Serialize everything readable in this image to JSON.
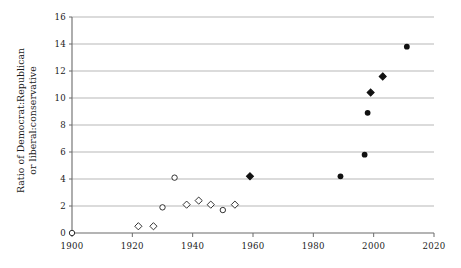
{
  "chart_data": {
    "type": "scatter",
    "title": "",
    "xlabel": "",
    "ylabel": "Ratio of Democrat:Republican or liberal:conservative",
    "ylabel_line1": "Ratio of Democrat:Republican",
    "ylabel_line2": "or liberal:conservative",
    "xlim": [
      1900,
      2020
    ],
    "ylim": [
      0,
      16
    ],
    "xticks": [
      1900,
      1920,
      1940,
      1960,
      1980,
      2000,
      2020
    ],
    "xtick_labels": [
      "1900",
      "1920",
      "1940",
      "1960",
      "1980",
      "2000",
      "2020"
    ],
    "yticks": [
      0,
      2,
      4,
      6,
      8,
      10,
      12,
      14,
      16
    ],
    "ytick_labels": [
      "0",
      "2",
      "4",
      "6",
      "8",
      "10",
      "12",
      "14",
      "16"
    ],
    "grid": "horizontal",
    "grid_color": "#9a9a9a",
    "axis_color": "#6b6b6b",
    "marker_color": "#111111",
    "series": [
      {
        "name": "open-circle",
        "marker": "open-circle",
        "points": [
          {
            "x": 1900,
            "y": 0.0
          },
          {
            "x": 1934,
            "y": 4.1
          },
          {
            "x": 1930,
            "y": 1.9
          },
          {
            "x": 1950,
            "y": 1.7
          }
        ]
      },
      {
        "name": "open-diamond",
        "marker": "open-diamond",
        "points": [
          {
            "x": 1922,
            "y": 0.5
          },
          {
            "x": 1927,
            "y": 0.5
          },
          {
            "x": 1938,
            "y": 2.1
          },
          {
            "x": 1942,
            "y": 2.4
          },
          {
            "x": 1946,
            "y": 2.1
          },
          {
            "x": 1954,
            "y": 2.1
          }
        ]
      },
      {
        "name": "filled-diamond",
        "marker": "filled-diamond",
        "points": [
          {
            "x": 1959,
            "y": 4.2
          },
          {
            "x": 1999,
            "y": 10.4
          },
          {
            "x": 2003,
            "y": 11.6
          }
        ]
      },
      {
        "name": "filled-circle",
        "marker": "filled-circle",
        "points": [
          {
            "x": 1989,
            "y": 4.2
          },
          {
            "x": 1997,
            "y": 5.8
          },
          {
            "x": 1998,
            "y": 8.9
          },
          {
            "x": 2011,
            "y": 13.8
          }
        ]
      }
    ]
  }
}
